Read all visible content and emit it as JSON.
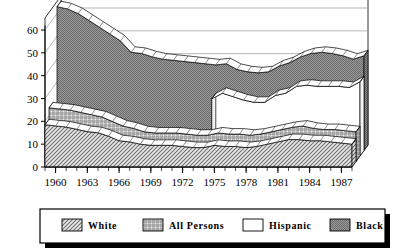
{
  "chart_data": {
    "type": "area",
    "title": "",
    "subtitle": "",
    "xlabel": "",
    "ylabel": "",
    "render_style": "3d-ribbon-area",
    "grid": true,
    "legend_position": "bottom",
    "xlim": [
      1959,
      1988
    ],
    "ylim": [
      0,
      65
    ],
    "y_ticks": [
      0,
      10,
      20,
      30,
      40,
      50,
      60
    ],
    "y_tick_labels": [
      "0",
      "10",
      "20",
      "30",
      "40",
      "50",
      "60"
    ],
    "x_tick_labels": [
      "1960",
      "1963",
      "1966",
      "1969",
      "1972",
      "1975",
      "1978",
      "1981",
      "1984",
      "1987"
    ],
    "x_tick_values": [
      1960,
      1963,
      1966,
      1969,
      1972,
      1975,
      1978,
      1981,
      1984,
      1987
    ],
    "x": [
      1959,
      1960,
      1961,
      1962,
      1963,
      1964,
      1965,
      1966,
      1967,
      1968,
      1969,
      1970,
      1971,
      1972,
      1973,
      1974,
      1975,
      1976,
      1977,
      1978,
      1979,
      1980,
      1981,
      1982,
      1983,
      1984,
      1985,
      1986,
      1987,
      1988
    ],
    "series": [
      {
        "name": "Black",
        "depth_order": 0,
        "fill": "#808080",
        "pattern": "dense-dot",
        "values": [
          63.0,
          62.0,
          60.0,
          57.0,
          54.0,
          51.0,
          48.0,
          43.0,
          42.5,
          41.0,
          40.0,
          39.5,
          39.0,
          38.5,
          38.0,
          37.5,
          38.0,
          35.5,
          34.5,
          34.0,
          34.5,
          37.0,
          38.5,
          41.0,
          42.5,
          43.0,
          42.5,
          41.5,
          40.0,
          41.5
        ]
      },
      {
        "name": "Hispanic",
        "depth_order": 1,
        "fill": "#ffffff",
        "pattern": "none",
        "values": [
          null,
          null,
          null,
          null,
          null,
          null,
          null,
          null,
          null,
          null,
          null,
          null,
          null,
          null,
          null,
          25.0,
          27.5,
          26.0,
          24.5,
          23.5,
          23.5,
          26.5,
          27.5,
          30.5,
          31.0,
          30.5,
          30.5,
          30.5,
          30.0,
          32.5
        ]
      },
      {
        "name": "All Persons",
        "depth_order": 2,
        "fill": "#c8c8c8",
        "pattern": "crosshatch",
        "values": [
          23.5,
          23.0,
          22.5,
          21.5,
          20.5,
          19.5,
          17.5,
          15.5,
          14.5,
          13.0,
          12.5,
          12.5,
          12.5,
          12.0,
          11.5,
          11.5,
          12.5,
          12.0,
          12.0,
          11.5,
          12.0,
          13.0,
          14.0,
          15.0,
          15.5,
          14.5,
          14.0,
          14.0,
          13.5,
          13.0
        ]
      },
      {
        "name": "White",
        "depth_order": 3,
        "fill": "#d9d9d9",
        "pattern": "diagonal-hatch",
        "values": [
          18.5,
          18.0,
          17.5,
          16.5,
          15.5,
          15.0,
          13.5,
          11.5,
          11.0,
          10.0,
          9.5,
          9.5,
          9.5,
          9.0,
          8.5,
          8.5,
          9.5,
          9.0,
          9.0,
          8.5,
          9.0,
          10.0,
          11.0,
          12.0,
          12.0,
          11.5,
          11.5,
          11.0,
          10.5,
          10.0
        ]
      }
    ]
  },
  "legend": {
    "items": [
      {
        "label": "White",
        "swatch": "diagonal-hatch"
      },
      {
        "label": "All Persons",
        "swatch": "crosshatch"
      },
      {
        "label": "Hispanic",
        "swatch": "none"
      },
      {
        "label": "Black",
        "swatch": "dense-dot"
      }
    ]
  },
  "colors": {
    "axis": "#000000",
    "grid": "#9a9a9a",
    "outline": "#000000",
    "black_series": "#808080",
    "all_persons_series": "#c8c8c8",
    "white_series": "#d9d9d9",
    "hispanic_series": "#ffffff",
    "legend_shadow": "#000000"
  }
}
